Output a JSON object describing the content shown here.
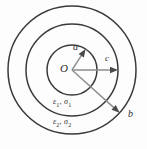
{
  "figure": {
    "background_color": "#fdfdfd",
    "stroke_color": "#3a3a3a",
    "arrow_color": "#8d8d8d",
    "center_label": "O",
    "radius_labels": {
      "inner": "a",
      "middle": "c",
      "outer": "b"
    },
    "medium_labels": {
      "inner_medium_symbol": "ε",
      "inner_medium_index": "1",
      "inner_medium_symbol2": "σ",
      "inner_medium_index2": "1",
      "outer_medium_symbol": "ε",
      "outer_medium_index": "2",
      "outer_medium_symbol2": "σ",
      "outer_medium_index2": "2",
      "inner_medium_text": "ε1, σ1",
      "outer_medium_text": "ε2, σ2",
      "separator": ", "
    }
  },
  "chart_data": {
    "type": "diagram",
    "title": "",
    "center": {
      "x": 72,
      "y": 70,
      "label": "O"
    },
    "circles": [
      {
        "name": "inner-circle",
        "radius": 25,
        "radius_label": "a"
      },
      {
        "name": "middle-circle",
        "radius": 46,
        "radius_label": "c"
      },
      {
        "name": "outer-circle",
        "radius": 64,
        "radius_label": "b"
      }
    ],
    "arrows": [
      {
        "label": "a",
        "angle_deg": 57,
        "radius": 25
      },
      {
        "label": "c",
        "angle_deg": 0,
        "radius": 46
      },
      {
        "label": "b",
        "angle_deg": -42,
        "radius": 64
      }
    ],
    "annotations": [
      {
        "text": "ε1, σ1",
        "region": "middle-annulus"
      },
      {
        "text": "ε2, σ2",
        "region": "outer-annulus"
      }
    ]
  }
}
